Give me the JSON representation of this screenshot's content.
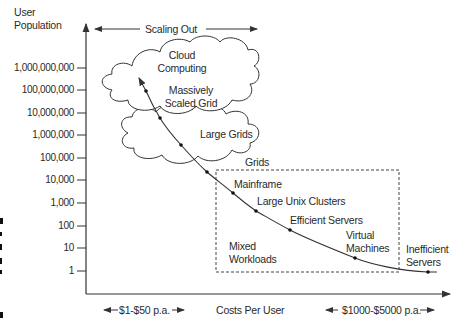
{
  "axes": {
    "y_label_line1": "User",
    "y_label_line2": "Population",
    "x_label": "Costs Per User",
    "y_ticks": [
      "1,000,000,000",
      "100,000,000",
      "10,000,000",
      "1,000,000",
      "100,000",
      "10,000",
      "1,000",
      "100",
      "10",
      "1"
    ],
    "x_left_range": "$1-$50 p.a.",
    "x_right_range": "$1000-$5000 p.a."
  },
  "top_annotation": "Scaling Out",
  "clouds": {
    "cloud_computing_line1": "Cloud",
    "cloud_computing_line2": "Computing",
    "massively_line1": "Massively",
    "massively_line2": "Scaled Grid",
    "large_grids": "Large Grids",
    "grids": "Grids"
  },
  "curve_points": [
    {
      "label_line1": "Mainframe",
      "label_line2": ""
    },
    {
      "label_line1": "Large Unix Clusters",
      "label_line2": ""
    },
    {
      "label_line1": "Efficient Servers",
      "label_line2": ""
    },
    {
      "label_line1": "Virtual",
      "label_line2": "Machines"
    },
    {
      "label_line1": "Inefficient",
      "label_line2": "Servers"
    }
  ],
  "box_label_line1": "Mixed",
  "box_label_line2": "Workloads",
  "colors": {
    "line": "#333333",
    "text": "#2a2a2a",
    "background": "#ffffff"
  }
}
